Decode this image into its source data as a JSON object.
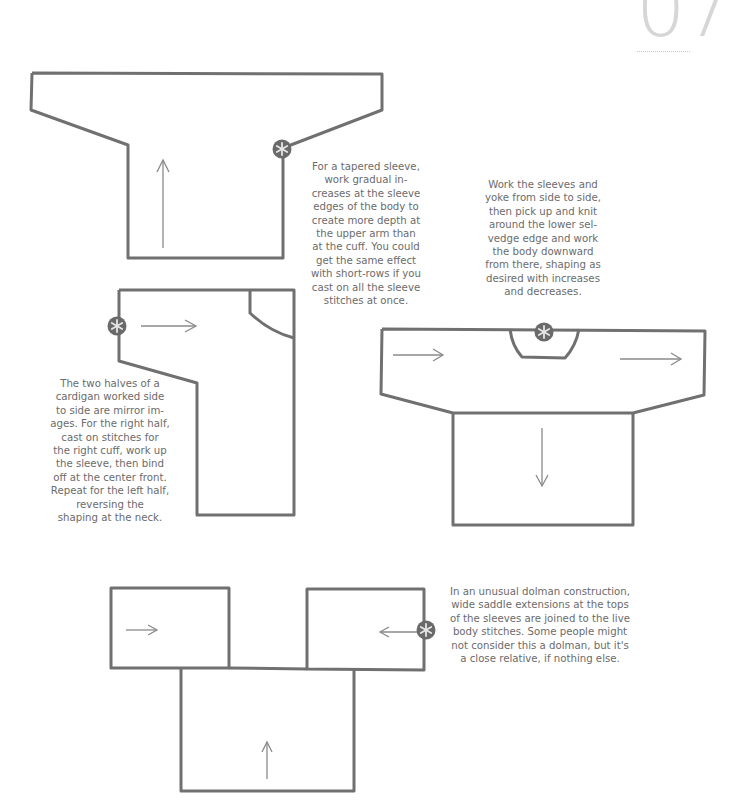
{
  "page": {
    "number": "07"
  },
  "diagrams": [
    {
      "id": "tapered-sleeve",
      "caption": "For a tapered sleeve,\nwork gradual in-\ncreases at the sleeve\nedges of the body to\ncreate more depth at\nthe upper arm than\nat the cuff. You could\nget the same effect\nwith short-rows if you\ncast on all the sleeve\nstitches at once.",
      "arrow_direction": "up",
      "start_marker": "asterisk"
    },
    {
      "id": "side-to-side-pullover",
      "caption": "Work the sleeves and\nyoke from side to side,\nthen pick up and knit\naround the lower sel-\nvedge edge and work\nthe body downward\nfrom there, shaping as\ndesired with increases\nand decreases.",
      "arrow_directions": [
        "right",
        "right",
        "down"
      ],
      "start_marker": "asterisk"
    },
    {
      "id": "side-to-side-cardigan",
      "caption": "The two halves of a\ncardigan worked side\nto side are mirror im-\nages. For the right half,\ncast on stitches for\nthe right cuff, work up\nthe sleeve, then bind\noff at the center front.\nRepeat for the left half,\nreversing the\nshaping at the neck.",
      "arrow_direction": "right",
      "start_marker": "asterisk"
    },
    {
      "id": "saddle-dolman",
      "caption": "In an unusual dolman construction,\nwide saddle extensions at the tops\nof the sleeves are joined to the live\nbody stitches. Some people might\nnot consider this a dolman, but it's\na close relative, if nothing else.",
      "arrow_directions": [
        "right",
        "left",
        "up"
      ],
      "start_marker": "asterisk"
    }
  ],
  "colors": {
    "outline": "#707070",
    "arrow": "#8a8a8a",
    "marker_fill": "#6a6a6a",
    "marker_glyph": "#e6e6e6",
    "caption_text": "#6b6b6b",
    "page_number": "#d6d6d6"
  }
}
